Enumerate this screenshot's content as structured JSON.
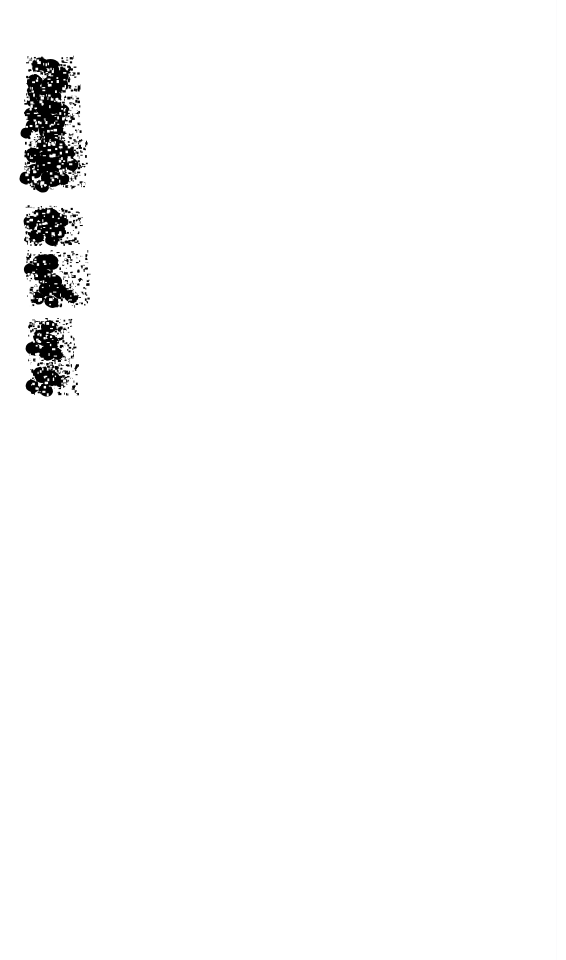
{
  "page": {
    "width": 566,
    "height": 960,
    "background_color": "#ffffff",
    "ink_color": "#000000",
    "document_type": "binarized handwriting scan",
    "legible_text": "",
    "caption": "Heavily thresholded scan fragment: dense black handwritten ink blobs in a narrow left column; remainder of page blank."
  },
  "edge_rule": {
    "name": "page-edge-line",
    "x": 556,
    "color": "#fbfbfc",
    "visible": true
  },
  "blank_area": {
    "name": "empty-page-body",
    "top": 400,
    "height": 560,
    "label": ""
  },
  "ink": {
    "color": "#000000",
    "bbox": {
      "x": 22,
      "y": 52,
      "width": 68,
      "height": 342
    },
    "line_groups": [
      {
        "id": "line-group-1",
        "bbox": {
          "x": 26,
          "y": 55,
          "width": 52,
          "height": 42
        },
        "speck_seed": 11,
        "speck_count": 210,
        "paths": [
          "M32 62 q5 -6 11 -4 q6 2 4 8 q-2 6 -9 6 q-8 0 -6 -10 z",
          "M45 60 q9 -3 14 3 q4 6 -2 10 q-7 4 -13 -1 q-5 -5 1 -12 z",
          "M58 66 q8 1 10 7 q2 7 -5 10 q-9 3 -12 -4 q-3 -8 7 -13 z",
          "M36 74 q7 3 6 9 q-1 7 -8 6 q-8 -1 -7 -8 q1 -7 9 -7 z",
          "M49 76 q12 0 14 8 q2 8 -8 10 q-11 2 -13 -6 q-2 -9 7 -12 z",
          "M62 78 q7 2 6 8 q-1 6 -8 5 q-7 -2 -5 -8 q1 -5 7 -5 z",
          "M30 86 q6 -2 9 3 q3 5 -2 8 q-6 3 -9 -2 q-3 -6 2 -9 z",
          "M42 88 q10 1 11 7 q1 7 -7 8 q-9 1 -10 -6 q-1 -7 6 -9 z",
          "M55 90 q8 3 6 9 q-2 6 -9 4 q-7 -2 -5 -8 q1 -5 8 -5 z",
          "M34 96 q5 4 3 8 q-3 5 -8 2 q-4 -3 -1 -8 q3 -4 6 -2 z"
        ]
      },
      {
        "id": "line-group-2",
        "bbox": {
          "x": 24,
          "y": 96,
          "width": 56,
          "height": 44
        },
        "speck_seed": 23,
        "speck_count": 230,
        "paths": [
          "M38 100 q9 -4 14 2 q5 6 -1 11 q-8 5 -14 -1 q-5 -6 1 -12 z",
          "M52 98 q10 2 10 9 q0 7 -8 7 q-9 0 -9 -8 q0 -7 7 -8 z",
          "M64 104 q7 3 5 9 q-3 6 -9 3 q-6 -3 -3 -9 q2 -4 7 -3 z",
          "M29 108 q6 -1 8 4 q2 6 -4 8 q-6 2 -8 -4 q-2 -6 4 -8 z",
          "M42 112 q12 0 13 8 q1 8 -9 9 q-10 1 -12 -7 q-1 -8 8 -10 z",
          "M57 114 q9 2 8 9 q-1 7 -9 6 q-8 -2 -6 -9 q1 -6 7 -6 z",
          "M33 120 q7 2 6 8 q-2 6 -8 4 q-7 -2 -5 -8 q2 -5 7 -4 z",
          "M46 124 q11 1 11 8 q0 7 -8 7 q-9 0 -10 -7 q-1 -7 7 -8 z",
          "M60 126 q7 3 5 8 q-2 6 -8 3 q-6 -2 -4 -8 q2 -4 7 -3 z",
          "M27 128 q5 2 4 7 q-2 5 -7 3 q-5 -2 -3 -7 q2 -4 6 -3 z"
        ]
      },
      {
        "id": "line-group-3",
        "bbox": {
          "x": 24,
          "y": 136,
          "width": 62,
          "height": 52
        },
        "speck_seed": 37,
        "speck_count": 300,
        "paths": [
          "M40 140 q10 -5 16 1 q6 7 -1 13 q-9 6 -16 -1 q-6 -7 1 -13 z",
          "M55 138 q11 2 11 10 q0 8 -9 8 q-10 0 -10 -9 q0 -8 8 -9 z",
          "M68 146 q8 3 6 10 q-3 7 -10 4 q-7 -3 -4 -10 q3 -5 8 -4 z",
          "M31 148 q7 -1 9 5 q2 7 -5 9 q-7 2 -9 -5 q-2 -7 5 -9 z",
          "M45 154 q13 0 14 9 q1 9 -10 10 q-11 1 -13 -8 q-2 -9 9 -11 z",
          "M60 156 q10 2 9 10 q-2 8 -10 6 q-9 -2 -7 -10 q2 -6 8 -6 z",
          "M73 158 q7 3 5 9 q-3 6 -9 3 q-6 -3 -3 -9 q3 -4 7 -3 z",
          "M35 164 q8 2 7 9 q-2 7 -9 5 q-8 -2 -6 -9 q2 -5 8 -5 z",
          "M49 170 q12 1 12 9 q0 8 -9 8 q-10 0 -11 -8 q-1 -8 8 -9 z",
          "M63 172 q8 3 6 9 q-3 6 -9 3 q-7 -3 -4 -9 q3 -4 7 -3 z",
          "M27 172 q6 2 5 8 q-2 6 -8 4 q-6 -2 -4 -8 q2 -5 7 -4 z",
          "M41 180 q9 2 8 8 q-2 6 -9 4 q-7 -3 -5 -9 q2 -4 6 -3 z"
        ]
      },
      {
        "id": "line-group-4",
        "bbox": {
          "x": 24,
          "y": 205,
          "width": 56,
          "height": 40
        },
        "speck_seed": 53,
        "speck_count": 200,
        "paths": [
          "M35 210 q9 -4 14 2 q5 7 -2 11 q-8 5 -13 -2 q-5 -6 1 -11 z",
          "M50 208 q10 2 10 9 q0 8 -9 7 q-9 -1 -8 -9 q0 -6 7 -7 z",
          "M62 214 q8 3 6 9 q-3 6 -9 3 q-7 -3 -4 -9 q3 -4 7 -3 z",
          "M28 216 q6 -1 8 5 q2 6 -4 8 q-6 2 -8 -5 q-2 -6 4 -8 z",
          "M44 220 q12 0 13 8 q1 8 -9 9 q-10 1 -11 -7 q-1 -8 7 -10 z",
          "M58 224 q9 2 8 9 q-2 7 -9 5 q-8 -2 -6 -9 q2 -5 7 -5 z",
          "M37 230 q8 2 7 8 q-2 6 -9 4 q-7 -3 -5 -9 q2 -4 7 -3 z",
          "M52 234 q8 3 6 8 q-3 6 -9 3 q-6 -3 -3 -8 q3 -4 6 -3 z"
        ]
      },
      {
        "id": "line-group-5",
        "bbox": {
          "x": 26,
          "y": 250,
          "width": 62,
          "height": 56
        },
        "speck_seed": 71,
        "speck_count": 250,
        "paths": [
          "M36 256 q9 -4 14 2 q5 7 -2 11 q-8 5 -13 -2 q-5 -6 1 -11 z",
          "M50 254 q9 2 9 9 q0 7 -8 7 q-9 -1 -8 -9 q0 -6 7 -7 z",
          "M42 268 q10 1 10 8 q0 8 -8 8 q-9 0 -10 -8 q-1 -7 8 -8 z",
          "M31 264 q6 1 5 7 q-2 6 -8 4 q-5 -2 -4 -7 q2 -5 7 -4 z",
          "M54 274 q9 2 8 9 q-2 7 -9 5 q-8 -3 -6 -9 q2 -5 7 -5 z",
          "M46 282 q10 2 9 9 q-2 7 -10 5 q-8 -3 -6 -9 q2 -5 7 -5 z",
          "M60 284 q9 3 7 10 q-3 7 -10 4 q-7 -4 -4 -10 q3 -5 7 -4 z",
          "M72 290 q8 3 6 9 q-3 6 -9 3 q-7 -3 -4 -9 q3 -4 7 -3 z",
          "M38 292 q7 2 6 8 q-2 6 -8 4 q-7 -3 -5 -8 q2 -5 7 -4 z",
          "M52 296 q8 3 6 8 q-3 6 -9 3 q-6 -3 -4 -8 q3 -4 7 -3 z"
        ]
      },
      {
        "id": "line-group-6",
        "bbox": {
          "x": 28,
          "y": 318,
          "width": 46,
          "height": 42
        },
        "speck_seed": 89,
        "speck_count": 210,
        "paths": [
          "M44 322 q7 -4 11 1 q4 6 -2 9 q-7 4 -11 -2 q-3 -5 2 -8 z",
          "M38 330 q9 -2 12 4 q3 7 -4 10 q-9 3 -12 -4 q-3 -7 4 -10 z",
          "M50 334 q9 2 9 9 q0 7 -8 7 q-9 -1 -8 -9 q0 -6 7 -7 z",
          "M33 342 q8 2 7 8 q-2 7 -9 5 q-7 -3 -5 -9 q2 -4 7 -4 z",
          "M46 346 q10 2 9 9 q-2 7 -10 5 q-8 -3 -6 -9 q2 -5 7 -5 z",
          "M58 348 q7 3 5 8 q-3 6 -8 3 q-6 -3 -4 -8 q3 -4 7 -3 z"
        ]
      },
      {
        "id": "line-group-7",
        "bbox": {
          "x": 30,
          "y": 362,
          "width": 46,
          "height": 32
        },
        "speck_seed": 97,
        "speck_count": 170,
        "paths": [
          "M36 368 q9 -4 14 2 q5 7 -2 11 q-8 5 -13 -2 q-5 -6 1 -11 z",
          "M50 370 q10 2 10 9 q0 8 -9 7 q-9 -1 -8 -9 q0 -6 7 -7 z",
          "M62 376 q7 3 5 8 q-3 6 -8 3 q-6 -3 -4 -8 q3 -4 7 -3 z",
          "M33 380 q7 2 6 8 q-2 6 -8 4 q-7 -3 -5 -8 q2 -5 7 -4 z",
          "M45 384 q9 2 8 8 q-2 6 -9 4 q-7 -3 -5 -8 q2 -5 6 -4 z"
        ]
      }
    ]
  }
}
